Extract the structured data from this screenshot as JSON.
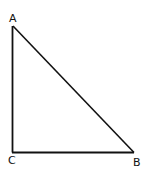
{
  "diagram": {
    "type": "right-triangle",
    "right_angle_at": "C",
    "vertices": [
      {
        "label": "A",
        "x": 13,
        "y": 26
      },
      {
        "label": "B",
        "x": 134,
        "y": 152
      },
      {
        "label": "C",
        "x": 12,
        "y": 152
      }
    ],
    "edges": [
      {
        "from": "A",
        "to": "C"
      },
      {
        "from": "C",
        "to": "B"
      },
      {
        "from": "A",
        "to": "B"
      }
    ],
    "stroke_color": "#111111"
  }
}
